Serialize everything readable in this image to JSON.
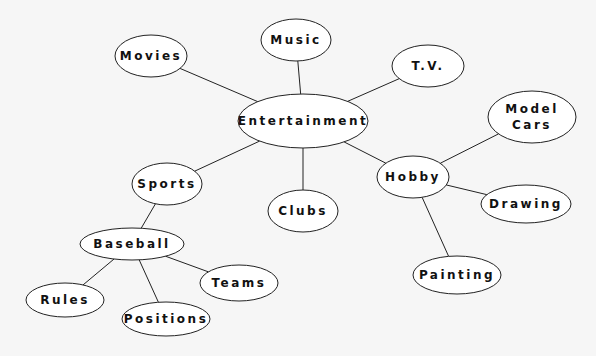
{
  "diagram": {
    "type": "mind-map",
    "nodes": [
      {
        "id": "entertainment",
        "lines": [
          "Entertainment"
        ]
      },
      {
        "id": "music",
        "lines": [
          "Music"
        ]
      },
      {
        "id": "movies",
        "lines": [
          "Movies"
        ]
      },
      {
        "id": "tv",
        "lines": [
          "T.V."
        ]
      },
      {
        "id": "sports",
        "lines": [
          "Sports"
        ]
      },
      {
        "id": "clubs",
        "lines": [
          "Clubs"
        ]
      },
      {
        "id": "hobby",
        "lines": [
          "Hobby"
        ]
      },
      {
        "id": "model-cars",
        "lines": [
          "Model",
          "Cars"
        ]
      },
      {
        "id": "drawing",
        "lines": [
          "Drawing"
        ]
      },
      {
        "id": "painting",
        "lines": [
          "Painting"
        ]
      },
      {
        "id": "baseball",
        "lines": [
          "Baseball"
        ]
      },
      {
        "id": "teams",
        "lines": [
          "Teams"
        ]
      },
      {
        "id": "rules",
        "lines": [
          "Rules"
        ]
      },
      {
        "id": "positions",
        "lines": [
          "Positions"
        ]
      }
    ],
    "edges": [
      [
        "entertainment",
        "music"
      ],
      [
        "entertainment",
        "movies"
      ],
      [
        "entertainment",
        "tv"
      ],
      [
        "entertainment",
        "sports"
      ],
      [
        "entertainment",
        "clubs"
      ],
      [
        "entertainment",
        "hobby"
      ],
      [
        "hobby",
        "model-cars"
      ],
      [
        "hobby",
        "drawing"
      ],
      [
        "hobby",
        "painting"
      ],
      [
        "sports",
        "baseball"
      ],
      [
        "baseball",
        "teams"
      ],
      [
        "baseball",
        "rules"
      ],
      [
        "baseball",
        "positions"
      ]
    ]
  }
}
